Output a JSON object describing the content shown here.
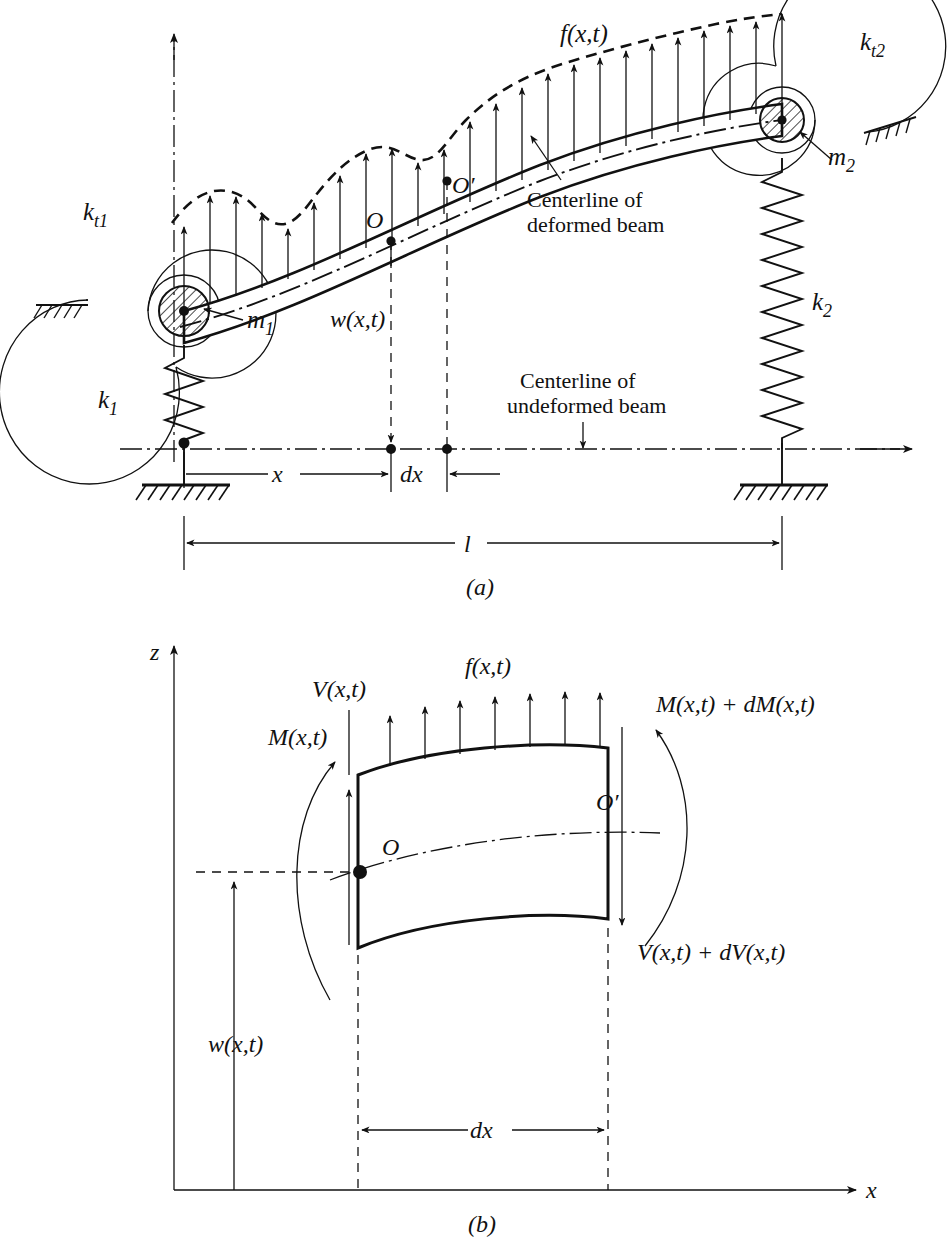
{
  "figure": {
    "panels": [
      {
        "id": "a",
        "caption": "(a)",
        "description": "Beam with end masses, translational and torsional springs, distributed load",
        "labels": {
          "z_axis": "z",
          "x_axis": "x",
          "load": "f(x,t)",
          "torsional_spring_left": "k",
          "torsional_spring_left_sub": "t1",
          "torsional_spring_right": "k",
          "torsional_spring_right_sub": "t2",
          "spring_left": "k",
          "spring_left_sub": "1",
          "spring_right": "k",
          "spring_right_sub": "2",
          "mass_left": "m",
          "mass_left_sub": "1",
          "mass_right": "m",
          "mass_right_sub": "2",
          "point_o": "O",
          "point_o_prime": "O′",
          "deflection": "w(x,t)",
          "dim_x": "x",
          "dim_dx": "dx",
          "dim_length": "l",
          "note_deformed_line1": "Centerline of",
          "note_deformed_line2": "deformed beam",
          "note_undeformed_line1": "Centerline of",
          "note_undeformed_line2": "undeformed beam"
        }
      },
      {
        "id": "b",
        "caption": "(b)",
        "description": "Differential beam element with shear forces and bending moments",
        "labels": {
          "z_axis": "z",
          "x_axis": "x",
          "load": "f(x,t)",
          "shear_left": "V(x,t)",
          "shear_right": "V(x,t) + dV(x,t)",
          "moment_left": "M(x,t)",
          "moment_right": "M(x,t) + dM(x,t)",
          "point_o": "O",
          "point_o_prime": "O′",
          "deflection": "w(x,t)",
          "dim_dx": "dx"
        }
      }
    ],
    "colors": {
      "ink": "#111111",
      "background": "#ffffff"
    }
  }
}
